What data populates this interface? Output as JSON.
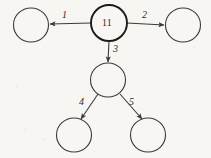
{
  "diagram": {
    "background_color": "#f7f6f2",
    "stroke_color": "#3a3a3a",
    "root_stroke_color": "#1a1a1a",
    "nodes": [
      {
        "id": "root",
        "label": "11",
        "cx": 109,
        "cy": 23,
        "r": 18,
        "emphasis": "bold",
        "has_label": true
      },
      {
        "id": "left",
        "label": "",
        "cx": 31,
        "cy": 25,
        "r": 17,
        "emphasis": "normal",
        "has_label": false
      },
      {
        "id": "right",
        "label": "",
        "cx": 183,
        "cy": 25,
        "r": 17,
        "emphasis": "normal",
        "has_label": false
      },
      {
        "id": "middle",
        "label": "",
        "cx": 108,
        "cy": 80,
        "r": 17,
        "emphasis": "normal",
        "has_label": false
      },
      {
        "id": "bottom-left",
        "label": "",
        "cx": 74,
        "cy": 135,
        "r": 17,
        "emphasis": "normal",
        "has_label": false
      },
      {
        "id": "bottom-right",
        "label": "",
        "cx": 148,
        "cy": 135,
        "r": 17,
        "emphasis": "normal",
        "has_label": false
      }
    ],
    "edges": [
      {
        "id": "e1",
        "label": "1",
        "from": "root",
        "to": "left",
        "x1": 91,
        "y1": 23,
        "x2": 50,
        "y2": 24,
        "label_x": 62,
        "label_y": 10
      },
      {
        "id": "e2",
        "label": "2",
        "from": "root",
        "to": "right",
        "x1": 127,
        "y1": 23,
        "x2": 164,
        "y2": 25,
        "label_x": 142,
        "label_y": 10
      },
      {
        "id": "e3",
        "label": "3",
        "from": "root",
        "to": "middle",
        "x1": 109,
        "y1": 41,
        "x2": 108,
        "y2": 62,
        "label_x": 113,
        "label_y": 44
      },
      {
        "id": "e4",
        "label": "4",
        "from": "middle",
        "to": "bottom-left",
        "x1": 98,
        "y1": 94,
        "x2": 81,
        "y2": 119,
        "label_x": 79,
        "label_y": 97
      },
      {
        "id": "e5",
        "label": "5",
        "from": "middle",
        "to": "bottom-right",
        "x1": 120,
        "y1": 94,
        "x2": 142,
        "y2": 119,
        "label_x": 129,
        "label_y": 97
      }
    ]
  }
}
